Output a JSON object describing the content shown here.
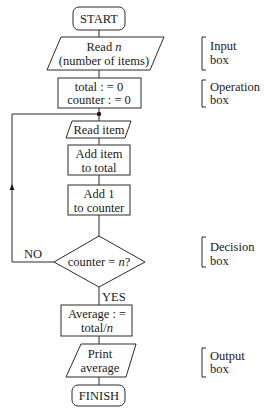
{
  "flowchart": {
    "start": "START",
    "input": {
      "line1": "Read n",
      "line1_text": "Read ",
      "line1_var": "n",
      "line2": "(number of items)"
    },
    "init": {
      "line1": "total : = 0",
      "line2": "counter : = 0"
    },
    "read_item": "Read item",
    "add_item": {
      "line1": "Add item",
      "line2": "to total"
    },
    "add_one": {
      "line1": "Add 1",
      "line2": "to counter"
    },
    "decision": {
      "text": "counter = ",
      "var": "n",
      "suffix": "?"
    },
    "no_label": "NO",
    "yes_label": "YES",
    "average": {
      "line1": "Average : =",
      "line2_text": "total/",
      "line2_var": "n"
    },
    "print": {
      "line1": "Print",
      "line2": "average"
    },
    "finish": "FINISH"
  },
  "annotations": [
    {
      "line1": "Input",
      "line2": "box"
    },
    {
      "line1": "Operation",
      "line2": "box"
    },
    {
      "line1": "Decision",
      "line2": "box"
    },
    {
      "line1": "Output",
      "line2": "box"
    }
  ]
}
